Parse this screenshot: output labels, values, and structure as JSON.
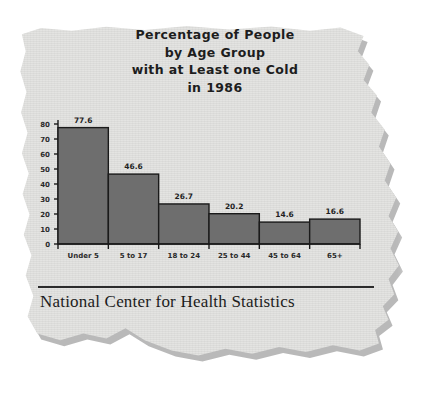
{
  "clipping": {
    "title_lines": [
      "Percentage of People",
      "by Age Group",
      "with at Least one Cold",
      "in 1986"
    ],
    "source": "National Center for Health Statistics",
    "paper_color": "#e3e3e1",
    "ink_color": "#1d1d1d"
  },
  "chart_data": {
    "type": "bar",
    "title": "Percentage of People by Age Group with at Least one Cold in 1986",
    "categories": [
      "Under 5",
      "5 to 17",
      "18 to 24",
      "25 to 44",
      "45 to 64",
      "65+"
    ],
    "values": [
      77.6,
      46.6,
      26.7,
      20.2,
      14.6,
      16.6
    ],
    "value_labels": [
      "77.6",
      "46.6",
      "26.7",
      "20.2",
      "14.6",
      "16.6"
    ],
    "xlabel": "",
    "ylabel": "",
    "ylim": [
      0,
      80
    ],
    "yticks": [
      80,
      70,
      60,
      50,
      40,
      30,
      20,
      10,
      0
    ],
    "ytick_labels": [
      "80",
      "70",
      "60",
      "50",
      "40",
      "30",
      "20",
      "10",
      "0"
    ],
    "grid": false,
    "legend": false,
    "bar_fill": "#6e6e6e",
    "bar_stroke": "#1a1a1a",
    "axis_color": "#1a1a1a"
  }
}
